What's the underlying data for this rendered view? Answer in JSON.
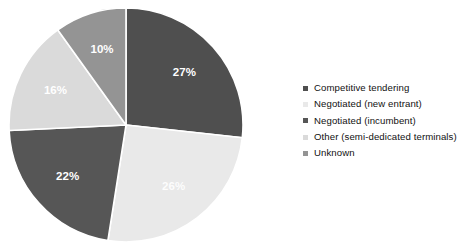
{
  "chart_data": {
    "type": "pie",
    "title": "",
    "subtitle": "",
    "xlabel": "",
    "ylabel": "",
    "grid": false,
    "legend_position": "right",
    "start_angle_deg": 0,
    "direction": "clockwise",
    "categories": [
      "Competitive tendering",
      "Negotiated (new entrant)",
      "Negotiated (incumbent)",
      "Other (semi-dedicated terminals)",
      "Unknown"
    ],
    "values": [
      27,
      26,
      22,
      16,
      10
    ],
    "value_labels": [
      "27%",
      "26%",
      "22%",
      "16%",
      "10%"
    ],
    "colors": [
      "#4f4f4f",
      "#e9e9e9",
      "#565656",
      "#dadada",
      "#949494"
    ],
    "label_color": "#ffffff"
  },
  "legend": {
    "items": [
      {
        "label": "Competitive tendering",
        "color": "#4f4f4f"
      },
      {
        "label": "Negotiated (new entrant)",
        "color": "#e9e9e9"
      },
      {
        "label": "Negotiated (incumbent)",
        "color": "#565656"
      },
      {
        "label": "Other (semi-dedicated terminals)",
        "color": "#dadada"
      },
      {
        "label": "Unknown",
        "color": "#949494"
      }
    ]
  },
  "slices": {
    "s0": {
      "label": "27%"
    },
    "s1": {
      "label": "26%"
    },
    "s2": {
      "label": "22%"
    },
    "s3": {
      "label": "16%"
    },
    "s4": {
      "label": "10%"
    }
  }
}
